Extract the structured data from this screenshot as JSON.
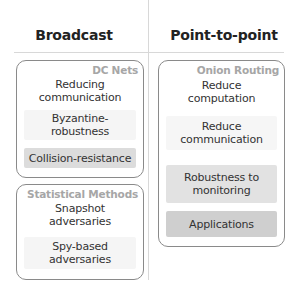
{
  "columns": {
    "left": {
      "header": "Broadcast"
    },
    "right": {
      "header": "Point-to-point"
    }
  },
  "groups": {
    "dc_nets": {
      "title": "DC Nets",
      "items": [
        {
          "label": "Reducing communication",
          "shade": "#ffffff"
        },
        {
          "label": "Byzantine-robustness",
          "shade": "#f5f5f5"
        },
        {
          "label": "Collision-resistance",
          "shade": "#dcdcdc"
        }
      ]
    },
    "statistical_methods": {
      "title": "Statistical Methods",
      "items": [
        {
          "label": "Snapshot adversaries",
          "shade": "#ffffff"
        },
        {
          "label": "Spy-based adversaries",
          "shade": "#f5f5f5"
        }
      ]
    },
    "onion_routing": {
      "title": "Onion Routing",
      "items": [
        {
          "label": "Reduce computation",
          "shade": "#ffffff"
        },
        {
          "label": "Reduce communication",
          "shade": "#f6f6f6"
        },
        {
          "label": "Robustness to monitoring",
          "shade": "#e2e2e2"
        },
        {
          "label": "Applications",
          "shade": "#cfcfcf"
        }
      ]
    }
  }
}
